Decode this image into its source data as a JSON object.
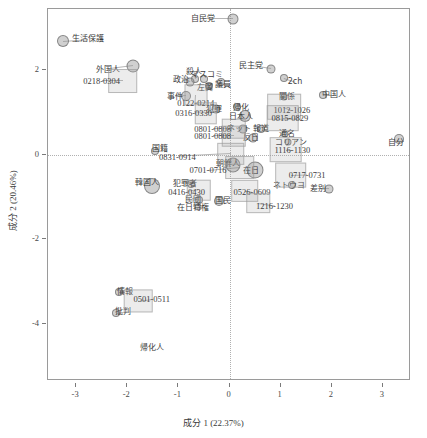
{
  "chart_data": {
    "type": "scatter",
    "title": "",
    "xlabel": "成分 1  (22.37%)",
    "ylabel": "成分 2  (20.46%)",
    "xlim": [
      -3.55,
      3.55
    ],
    "ylim": [
      -5.35,
      3.45
    ],
    "xticks": [
      -3,
      -2,
      -1,
      0,
      1,
      2,
      3
    ],
    "xticklabels": [
      "-3",
      "-2",
      "-1",
      "0",
      "1",
      "2",
      "3"
    ],
    "yticks": [
      2,
      0,
      -2,
      -4
    ],
    "yticklabels": [
      "2",
      "0",
      "-2",
      "-4"
    ],
    "grid": "zero-lines-dotted",
    "legend": "none",
    "accent_color": "#969696",
    "frame_color": "#9a9a9a",
    "series": [
      {
        "name": "語 (terms)",
        "marker": "circle",
        "points": [
          {
            "label": "自民党",
            "x": 0.06,
            "y": 3.22,
            "size": 9,
            "lx": -0.52,
            "ly": 3.22
          },
          {
            "label": "生活保護",
            "x": -3.25,
            "y": 2.7,
            "size": 10,
            "lx": -2.76,
            "ly": 2.74
          },
          {
            "label": "外国人",
            "x": -1.88,
            "y": 2.09,
            "size": 11,
            "lx": -2.37,
            "ly": 2.01
          },
          {
            "label": "民主党",
            "x": 0.82,
            "y": 2.03,
            "size": 7,
            "lx": 0.43,
            "ly": 2.1
          },
          {
            "label": "2ch",
            "x": 1.06,
            "y": 1.82,
            "size": 6,
            "lx": 1.28,
            "ly": 1.73
          },
          {
            "label": "殺人",
            "x": -0.67,
            "y": 1.79,
            "size": 6,
            "lx": -0.7,
            "ly": 1.96
          },
          {
            "label": "マスコミ",
            "x": -0.49,
            "y": 1.79,
            "size": 6,
            "lx": -0.44,
            "ly": 1.89
          },
          {
            "label": "政治",
            "x": -0.78,
            "y": 1.72,
            "size": 7,
            "lx": -0.94,
            "ly": 1.77
          },
          {
            "label": "左翼",
            "x": -0.4,
            "y": 1.63,
            "size": 6,
            "lx": -0.47,
            "ly": 1.58
          },
          {
            "label": "議員",
            "x": -0.16,
            "y": 1.72,
            "size": 6,
            "lx": -0.12,
            "ly": 1.66
          },
          {
            "label": "中国人",
            "x": 1.83,
            "y": 1.42,
            "size": 6,
            "lx": 2.04,
            "ly": 1.42
          },
          {
            "label": "事件",
            "x": -0.86,
            "y": 1.39,
            "size": 8,
            "lx": -1.07,
            "ly": 1.38
          },
          {
            "label": "関係",
            "x": 1.06,
            "y": 1.38,
            "size": 5,
            "lx": 1.13,
            "ly": 1.38
          },
          {
            "label": "犯罪",
            "x": -0.27,
            "y": 1.09,
            "size": 7,
            "lx": -0.3,
            "ly": 1.05
          },
          {
            "label": "帰化",
            "x": 0.14,
            "y": 1.12,
            "size": 6,
            "lx": 0.23,
            "ly": 1.1
          },
          {
            "label": "日本人",
            "x": 0.3,
            "y": 0.93,
            "size": 10,
            "lx": 0.22,
            "ly": 0.9
          },
          {
            "label": "ネット",
            "x": 0.26,
            "y": 0.62,
            "size": 7,
            "lx": 0.18,
            "ly": 0.61
          },
          {
            "label": "報道",
            "x": 0.61,
            "y": 0.62,
            "size": 6,
            "lx": 0.62,
            "ly": 0.61
          },
          {
            "label": "反日",
            "x": 0.45,
            "y": 0.41,
            "size": 7,
            "lx": 0.43,
            "ly": 0.4
          },
          {
            "label": "通名",
            "x": 1.09,
            "y": 0.5,
            "size": 5,
            "lx": 1.13,
            "ly": 0.5
          },
          {
            "label": "コリアン",
            "x": 1.14,
            "y": 0.3,
            "size": 5,
            "lx": 1.21,
            "ly": 0.29
          },
          {
            "label": "自分",
            "x": 3.32,
            "y": 0.38,
            "size": 8,
            "lx": 3.26,
            "ly": 0.28
          },
          {
            "label": "国籍",
            "x": -1.45,
            "y": 0.1,
            "size": 6,
            "lx": -1.36,
            "ly": 0.14
          },
          {
            "label": "朝鮮人",
            "x": 0.07,
            "y": -0.23,
            "size": 13,
            "lx": -0.03,
            "ly": -0.22
          },
          {
            "label": "在日",
            "x": 0.49,
            "y": -0.37,
            "size": 15,
            "lx": 0.43,
            "ly": -0.38
          },
          {
            "label": "ネトウヨ",
            "x": 1.22,
            "y": -0.72,
            "size": 6,
            "lx": 1.17,
            "ly": -0.73
          },
          {
            "label": "差別",
            "x": 1.94,
            "y": -0.8,
            "size": 7,
            "lx": 1.73,
            "ly": -0.8
          },
          {
            "label": "韓国人",
            "x": -1.52,
            "y": -0.74,
            "size": 14,
            "lx": -1.62,
            "ly": -0.67
          },
          {
            "label": "犯罪者",
            "x": -0.75,
            "y": -0.7,
            "size": 6,
            "lx": -0.87,
            "ly": -0.68
          },
          {
            "label": "民団",
            "x": -0.59,
            "y": -1.08,
            "size": 6,
            "lx": -0.72,
            "ly": -1.06
          },
          {
            "label": "在日特権",
            "x": -0.62,
            "y": -1.23,
            "size": 5,
            "lx": -0.72,
            "ly": -1.25
          },
          {
            "label": "国民",
            "x": -0.21,
            "y": -1.1,
            "size": 8,
            "lx": -0.12,
            "ly": -1.1
          },
          {
            "label": "情報",
            "x": -2.16,
            "y": -3.24,
            "size": 6,
            "lx": -2.04,
            "ly": -3.24
          },
          {
            "label": "批判",
            "x": -2.22,
            "y": -3.73,
            "size": 6,
            "lx": -2.09,
            "ly": -3.71
          },
          {
            "label": "帰化人",
            "x": -1.52,
            "y": -4.56,
            "size": 0,
            "lx": -1.52,
            "ly": -4.56
          }
        ]
      },
      {
        "name": "期間 (periods)",
        "marker": "square",
        "points": [
          {
            "label": "0218-0304",
            "x": -2.09,
            "y": 1.74,
            "w": 0.54,
            "h": 0.52,
            "lx": -2.5,
            "ly": 1.74
          },
          {
            "label": "0122-0214",
            "x": -0.65,
            "y": 1.42,
            "w": 0.41,
            "h": 0.46,
            "lx": -0.66,
            "ly": 1.23
          },
          {
            "label": "0316-0330",
            "x": -0.46,
            "y": 0.98,
            "w": 0.4,
            "h": 0.46,
            "lx": -0.7,
            "ly": 1.0
          },
          {
            "label": "1012-1026",
            "x": 1.07,
            "y": 1.14,
            "w": 0.62,
            "h": 0.58,
            "lx": 1.22,
            "ly": 1.06
          },
          {
            "label": "0815-0829",
            "x": 1.04,
            "y": 0.86,
            "w": 0.6,
            "h": 0.56,
            "lx": 1.18,
            "ly": 0.86
          },
          {
            "label": "0801-0808",
            "x": 0.08,
            "y": 0.62,
            "w": 0.44,
            "h": 0.44,
            "lx": -0.33,
            "ly": 0.62
          },
          {
            "label": "0801-0808",
            "x": 0.08,
            "y": 0.44,
            "w": 0.44,
            "h": 0.44,
            "lx": -0.33,
            "ly": 0.44
          },
          {
            "label": "0831-0914",
            "x": 0.02,
            "y": 0.02,
            "w": 0.5,
            "h": 0.48,
            "lx": -1.02,
            "ly": -0.04
          },
          {
            "label": "1116-1130",
            "x": 1.1,
            "y": 0.12,
            "w": 0.6,
            "h": 0.56,
            "lx": 1.23,
            "ly": 0.12
          },
          {
            "label": "0701-0716",
            "x": 0.2,
            "y": -0.3,
            "w": 0.54,
            "h": 0.52,
            "lx": -0.42,
            "ly": -0.37
          },
          {
            "label": "0717-0731",
            "x": 1.2,
            "y": -0.48,
            "w": 0.58,
            "h": 0.54,
            "lx": 1.52,
            "ly": -0.47
          },
          {
            "label": "0416-0430",
            "x": -0.6,
            "y": -0.84,
            "w": 0.44,
            "h": 0.44,
            "lx": -0.84,
            "ly": -0.88
          },
          {
            "label": "0526-0609",
            "x": 0.3,
            "y": -0.86,
            "w": 0.5,
            "h": 0.48,
            "lx": 0.44,
            "ly": -0.88
          },
          {
            "label": "1216-1230",
            "x": 0.56,
            "y": -1.14,
            "w": 0.42,
            "h": 0.42,
            "lx": 0.88,
            "ly": -1.2
          },
          {
            "label": "0501-0511",
            "x": -1.78,
            "y": -3.46,
            "w": 0.52,
            "h": 0.5,
            "lx": -1.52,
            "ly": -3.42
          }
        ]
      }
    ]
  }
}
